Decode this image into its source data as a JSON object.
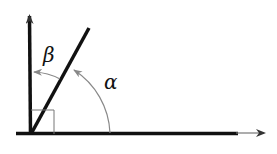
{
  "diagram": {
    "title": "",
    "labels": {
      "alpha": "α",
      "beta": "β"
    },
    "elements": [
      {
        "id": "vertical-axis",
        "type": "ray",
        "from": [
          31,
          134
        ],
        "to": [
          30,
          14
        ],
        "arrow": true
      },
      {
        "id": "horizontal-axis",
        "type": "ray",
        "from": [
          18,
          133
        ],
        "to": [
          265,
          133
        ],
        "arrow": true
      },
      {
        "id": "diagonal-ray",
        "type": "segment",
        "from": [
          31,
          134
        ],
        "to": [
          89,
          28
        ]
      },
      {
        "id": "right-angle-marker",
        "type": "square",
        "corner": [
          31,
          110
        ],
        "size": 23
      },
      {
        "id": "alpha-arc",
        "type": "arc",
        "between": [
          "horizontal-axis",
          "diagonal-ray"
        ]
      },
      {
        "id": "beta-arc",
        "type": "arc",
        "between": [
          "diagonal-ray",
          "vertical-axis"
        ]
      }
    ],
    "colors": {
      "line": "#111111",
      "arc": "#888888",
      "marker": "#777777"
    }
  }
}
